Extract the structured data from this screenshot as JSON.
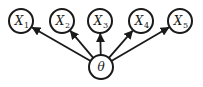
{
  "diagram": {
    "type": "graphical-model",
    "parent": {
      "id": "theta",
      "label": "θ",
      "x": 101,
      "y": 67
    },
    "children": [
      {
        "id": "X1",
        "label": "X",
        "subscript": "1",
        "x": 21,
        "y": 21
      },
      {
        "id": "X2",
        "label": "X",
        "subscript": "2",
        "x": 62,
        "y": 21
      },
      {
        "id": "X3",
        "label": "X",
        "subscript": "3",
        "x": 100,
        "y": 21
      },
      {
        "id": "X4",
        "label": "X",
        "subscript": "4",
        "x": 141,
        "y": 21
      },
      {
        "id": "X5",
        "label": "X",
        "subscript": "5",
        "x": 180,
        "y": 21
      }
    ],
    "edges": [
      {
        "from": "theta",
        "to": "X1"
      },
      {
        "from": "theta",
        "to": "X2"
      },
      {
        "from": "theta",
        "to": "X3"
      },
      {
        "from": "theta",
        "to": "X4"
      },
      {
        "from": "theta",
        "to": "X5"
      }
    ],
    "node_radius": 12,
    "stroke_color": "#1a1a1a"
  }
}
